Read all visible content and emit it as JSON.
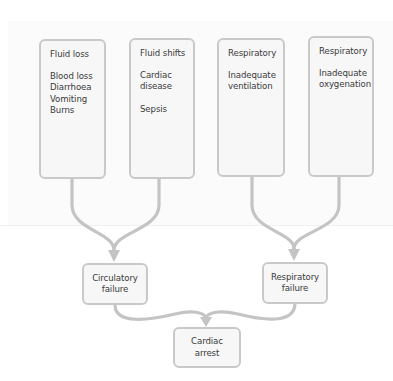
{
  "diagram": {
    "type": "flowchart",
    "colors": {
      "box_fill": "#f7f7f7",
      "box_border": "#c9c9c9",
      "connector": "#c4c4c4",
      "text": "#3a3a3a"
    },
    "causes": [
      {
        "title": "Fluid loss",
        "groups": [
          [
            "Blood loss",
            "Diarrhoea",
            "Vomiting",
            "Burns"
          ]
        ]
      },
      {
        "title": "Fluid shifts",
        "groups": [
          [
            "Cardiac",
            "disease"
          ],
          [
            "Sepsis"
          ]
        ]
      },
      {
        "title": "Respiratory",
        "groups": [
          [
            "Inadequate",
            "ventilation"
          ]
        ]
      },
      {
        "title": "Respiratory",
        "groups": [
          [
            "Inadequate",
            "oxygenation"
          ]
        ]
      }
    ],
    "intermediate": [
      {
        "label": "Circulatory\nfailure"
      },
      {
        "label": "Respiratory\nfailure"
      }
    ],
    "final": {
      "label": "Cardiac\narrest"
    },
    "edges": [
      {
        "from": "Fluid loss",
        "to": "Circulatory failure"
      },
      {
        "from": "Fluid shifts",
        "to": "Circulatory failure"
      },
      {
        "from": "Respiratory (Inadequate ventilation)",
        "to": "Respiratory failure"
      },
      {
        "from": "Respiratory (Inadequate oxygenation)",
        "to": "Respiratory failure"
      },
      {
        "from": "Circulatory failure",
        "to": "Cardiac arrest"
      },
      {
        "from": "Respiratory failure",
        "to": "Cardiac arrest"
      }
    ]
  }
}
